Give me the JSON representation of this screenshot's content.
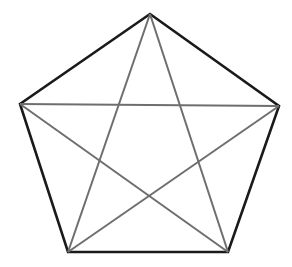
{
  "diagram": {
    "type": "pentagon-with-pentagram",
    "vertices": {
      "top": [
        150,
        14
      ],
      "left": [
        20,
        104
      ],
      "right": [
        279,
        106
      ],
      "bottom_left": [
        68,
        252
      ],
      "bottom_right": [
        228,
        252
      ]
    },
    "outline_color": "#1a1a1a",
    "diagonal_color": "#6e6e6e",
    "background": "#ffffff"
  }
}
